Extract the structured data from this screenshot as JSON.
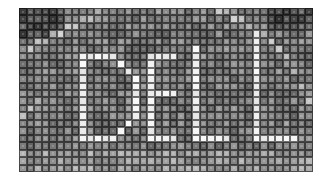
{
  "image": {
    "subject": "Pixelated mosaic of the DELL logo",
    "logo_text": "DELL",
    "grid": {
      "cols": 39,
      "rows": 22
    },
    "colors": {
      "dark": "#2a2a2a",
      "mid": "#6e6e6e",
      "light": "#b8b8b8",
      "white": "#f2f2f2"
    },
    "letters": [
      {
        "char": "D",
        "col_start": 7,
        "col_end": 16,
        "row_start": 6,
        "row_end": 17
      },
      {
        "char": "E",
        "col_start": 14,
        "col_end": 19,
        "row_start": 5,
        "row_end": 17
      },
      {
        "char": "L",
        "col_start": 22,
        "col_end": 28,
        "row_start": 6,
        "row_end": 17
      },
      {
        "char": "L",
        "col_start": 30,
        "col_end": 35,
        "row_start": 4,
        "row_end": 17
      }
    ]
  }
}
